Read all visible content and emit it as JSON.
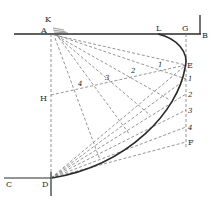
{
  "diagram": {
    "type": "geometric-construction",
    "colors": {
      "ink": "#2a2a2a",
      "dashed": "#7a7a7a",
      "background": "#ffffff"
    },
    "points": {
      "K": {
        "label": "K",
        "x": 50,
        "y": 20
      },
      "A": {
        "label": "A",
        "x": 51,
        "y": 34
      },
      "L": {
        "label": "L",
        "x": 160,
        "y": 34
      },
      "G": {
        "label": "G",
        "x": 186,
        "y": 34
      },
      "B": {
        "label": "B",
        "x": 200,
        "y": 34
      },
      "E": {
        "label": "E",
        "x": 186,
        "y": 65
      },
      "H": {
        "label": "H",
        "x": 51,
        "y": 97
      },
      "F": {
        "label": "F",
        "x": 186,
        "y": 142
      },
      "C": {
        "label": "C",
        "x": 6,
        "y": 178
      },
      "D": {
        "label": "D",
        "x": 51,
        "y": 178
      }
    },
    "right_scale": [
      {
        "label": "1",
        "x": 186,
        "y": 79
      },
      {
        "label": "2",
        "x": 186,
        "y": 94
      },
      {
        "label": "3",
        "x": 186,
        "y": 110
      },
      {
        "label": "4",
        "x": 186,
        "y": 127
      }
    ],
    "inner_points": [
      {
        "label": "1",
        "x": 163,
        "y": 69
      },
      {
        "label": "2",
        "x": 134,
        "y": 75
      },
      {
        "label": "3",
        "x": 108,
        "y": 81
      },
      {
        "label": "4",
        "x": 79,
        "y": 88
      }
    ],
    "labels": {
      "K": "K",
      "A": "A",
      "L": "L",
      "G": "G",
      "B": "B",
      "E": "E",
      "H": "H",
      "F": "F",
      "C": "C",
      "D": "D",
      "r1": "1",
      "r2": "2",
      "r3": "3",
      "r4": "4",
      "i1": "1",
      "i2": "2",
      "i3": "3",
      "i4": "4"
    }
  }
}
